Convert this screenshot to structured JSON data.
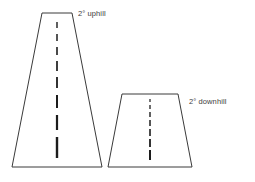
{
  "figure": {
    "width": 255,
    "height": 182,
    "background_color": "#ffffff",
    "line_color": "#3a3a3a",
    "dash_color": "#1c1c1c",
    "text_color": "#3c3c3c"
  },
  "labels": {
    "uphill": "2° uphill",
    "downhill": "2° downhill"
  },
  "shapes": {
    "uphill_road": {
      "name": "uphill-road-trapezoid",
      "points": "42,13 72,13 102,167 12,167",
      "top_left_x": 42,
      "top_right_x": 72,
      "top_y": 13,
      "bottom_left_x": 12,
      "bottom_right_x": 102,
      "bottom_y": 167,
      "center_x": 57,
      "dashes": [
        {
          "y1": 22,
          "y2": 28,
          "width": 1.4
        },
        {
          "y1": 34,
          "y2": 41,
          "width": 1.5
        },
        {
          "y1": 47,
          "y2": 55,
          "width": 1.6
        },
        {
          "y1": 61,
          "y2": 71,
          "width": 1.7
        },
        {
          "y1": 77,
          "y2": 88,
          "width": 1.8
        },
        {
          "y1": 95,
          "y2": 108,
          "width": 2.0
        },
        {
          "y1": 115,
          "y2": 130,
          "width": 2.2
        },
        {
          "y1": 137,
          "y2": 158,
          "width": 2.4
        }
      ]
    },
    "downhill_road": {
      "name": "downhill-road-trapezoid",
      "points": "122,94 178,94 192,167 108,167",
      "top_left_x": 122,
      "top_right_x": 178,
      "top_y": 94,
      "bottom_left_x": 108,
      "bottom_right_x": 192,
      "bottom_y": 167,
      "center_x": 150,
      "dashes": [
        {
          "y1": 99,
          "y2": 102,
          "width": 1.2
        },
        {
          "y1": 105,
          "y2": 109,
          "width": 1.3
        },
        {
          "y1": 112,
          "y2": 117,
          "width": 1.4
        },
        {
          "y1": 120,
          "y2": 126,
          "width": 1.5
        },
        {
          "y1": 129,
          "y2": 136,
          "width": 1.6
        },
        {
          "y1": 139,
          "y2": 147,
          "width": 1.8
        },
        {
          "y1": 150,
          "y2": 160,
          "width": 2.0
        }
      ]
    }
  }
}
